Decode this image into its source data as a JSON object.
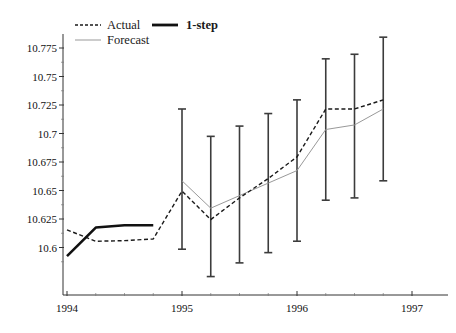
{
  "chart_data": {
    "type": "line",
    "title": "",
    "xlabel": "",
    "ylabel": "",
    "xlim": [
      1993.72,
      1997.22
    ],
    "ylim": [
      10.584,
      10.787
    ],
    "grid": false,
    "legend_position": "top-left",
    "xticks": [
      1994,
      1995,
      1996,
      1997
    ],
    "xtick_labels": [
      "1994",
      "1995",
      "1996",
      "1997"
    ],
    "xminor_ticks": [
      1994.25,
      1994.5,
      1994.75,
      1995.25,
      1995.5,
      1995.75,
      1996.25,
      1996.5,
      1996.75
    ],
    "yticks": [
      10.6,
      10.625,
      10.65,
      10.675,
      10.7,
      10.725,
      10.75,
      10.775
    ],
    "ytick_labels": [
      "10.6",
      "10.625",
      "10.65",
      "10.675",
      "10.7",
      "10.725",
      "10.75",
      "10.775"
    ],
    "yminor_ticks": [
      10.5875,
      10.6125,
      10.6375,
      10.6625,
      10.6875,
      10.7125,
      10.7375,
      10.7625
    ],
    "series": [
      {
        "name": "Actual",
        "style": "dashed",
        "color": "#1a1a1a",
        "width": 1.4,
        "x": [
          1994.0,
          1994.25,
          1994.5,
          1994.75,
          1995.0,
          1995.25,
          1995.5,
          1995.75,
          1996.0,
          1996.25,
          1996.5,
          1996.75
        ],
        "y": [
          10.6155,
          10.6055,
          10.606,
          10.6075,
          10.6495,
          10.6245,
          10.6435,
          10.6605,
          10.6795,
          10.7215,
          10.7215,
          10.7295
        ]
      },
      {
        "name": "Forecast",
        "style": "solid-thin",
        "color": "#999999",
        "width": 1.0,
        "x": [
          1995.0,
          1995.25,
          1995.5,
          1995.75,
          1996.0,
          1996.25,
          1996.5,
          1996.75
        ],
        "y": [
          10.6585,
          10.6345,
          10.6455,
          10.6565,
          10.6675,
          10.7035,
          10.7075,
          10.7215
        ]
      },
      {
        "name": "1-step",
        "style": "solid-thick",
        "color": "#111111",
        "width": 2.6,
        "x": [
          1994.0,
          1994.25,
          1994.5,
          1994.75
        ],
        "y": [
          10.5925,
          10.6175,
          10.6195,
          10.6195
        ]
      }
    ],
    "error_bars": {
      "series": "Forecast",
      "color": "#3c3c3c",
      "cap_width_px": 8,
      "points": [
        {
          "x": 1995.0,
          "lower": 10.5985,
          "upper": 10.7215
        },
        {
          "x": 1995.25,
          "lower": 10.5745,
          "upper": 10.6975
        },
        {
          "x": 1995.5,
          "lower": 10.5865,
          "upper": 10.7065
        },
        {
          "x": 1995.75,
          "lower": 10.5955,
          "upper": 10.7175
        },
        {
          "x": 1996.0,
          "lower": 10.6055,
          "upper": 10.7295
        },
        {
          "x": 1996.25,
          "lower": 10.6415,
          "upper": 10.7655
        },
        {
          "x": 1996.5,
          "lower": 10.6435,
          "upper": 10.7695
        },
        {
          "x": 1996.75,
          "lower": 10.6585,
          "upper": 10.7845
        }
      ]
    },
    "legend": [
      {
        "label": "Actual",
        "style": "dashed",
        "color": "#1a1a1a",
        "bold": false
      },
      {
        "label": "1-step",
        "style": "solid-thick",
        "color": "#111111",
        "bold": true
      },
      {
        "label": "Forecast",
        "style": "solid-thin",
        "color": "#999999",
        "bold": false
      }
    ]
  },
  "axes": {
    "axis_color": "#333333",
    "background": "#ffffff"
  }
}
